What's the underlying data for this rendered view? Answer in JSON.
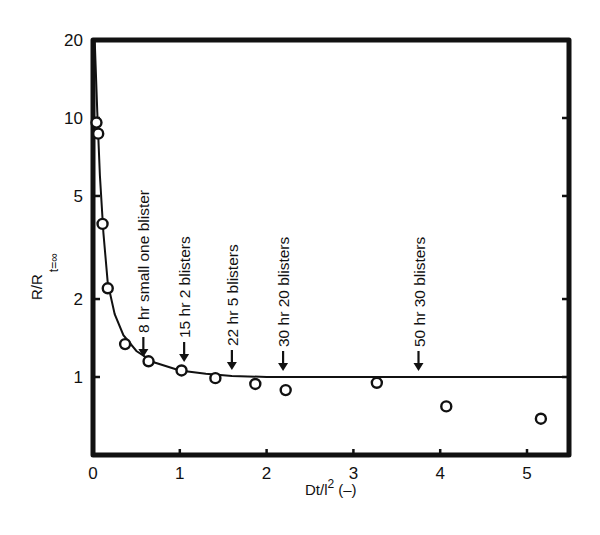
{
  "chart_data": {
    "type": "scatter",
    "title": "",
    "xlabel": "Dt/l² (–)",
    "xlabel_main": "Dt/l",
    "xlabel_sup": "2",
    "xlabel_unit": "(–)",
    "ylabel": "R/R t=∞",
    "ylabel_main": "R/R",
    "ylabel_sub": "t=∞",
    "xlim": [
      0,
      5.5
    ],
    "ylim": [
      0.5,
      20
    ],
    "yscale": "log",
    "grid": false,
    "legend": null,
    "x_ticks": [
      0,
      1,
      2,
      3,
      4,
      5
    ],
    "x_tick_labels": [
      "0",
      "1",
      "2",
      "3",
      "4",
      "5"
    ],
    "y_ticks": [
      1,
      2,
      5,
      10,
      20
    ],
    "y_tick_labels": [
      "1",
      "2",
      "5",
      "10",
      "20"
    ],
    "series": [
      {
        "name": "measured",
        "marker": "open-circle",
        "x": [
          0.04,
          0.06,
          0.11,
          0.17,
          0.37,
          0.64,
          1.02,
          1.41,
          1.87,
          2.22,
          3.27,
          4.07,
          5.16
        ],
        "y": [
          9.6,
          8.7,
          3.9,
          2.2,
          1.34,
          1.15,
          1.06,
          0.99,
          0.94,
          0.89,
          0.95,
          0.77,
          0.69
        ]
      },
      {
        "name": "fitted curve",
        "type": "line",
        "x": [
          0.02,
          0.03,
          0.05,
          0.08,
          0.12,
          0.17,
          0.25,
          0.35,
          0.5,
          0.7,
          1.0,
          1.3,
          1.6,
          2.0,
          2.5,
          3.0,
          4.0,
          5.5
        ],
        "y": [
          22,
          16,
          10.5,
          6.0,
          3.6,
          2.3,
          1.75,
          1.45,
          1.26,
          1.14,
          1.06,
          1.03,
          1.01,
          1.0,
          1.0,
          1.0,
          1.0,
          1.0
        ]
      }
    ],
    "annotations": [
      {
        "x": 0.58,
        "label": "8 hr  small one blister"
      },
      {
        "x": 1.05,
        "label": "15 hr   2 blisters"
      },
      {
        "x": 1.6,
        "label": "22 hr   5 blisters"
      },
      {
        "x": 2.19,
        "label": "30 hr   20 blisters"
      },
      {
        "x": 3.75,
        "label": "50 hr   30 blisters"
      }
    ]
  }
}
